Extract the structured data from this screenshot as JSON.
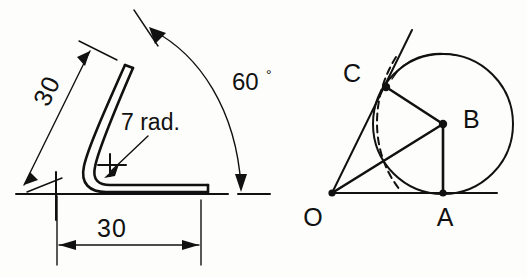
{
  "drawing": {
    "title": "Bent rod dimensioned view and tangent circle construction",
    "background_color": "#fdfdfb",
    "line_color": "#111111"
  },
  "left_figure": {
    "name": "bent-rod-dimensioned-view",
    "dimensions": {
      "leg_angled_length": "30",
      "leg_horizontal_length": "30",
      "bend_angle": "60",
      "degree_symbol": "°",
      "bend_radius_note": "7 rad."
    },
    "labels": {
      "angled_dimension": "30",
      "horizontal_dimension": "30",
      "angle_dimension": "60",
      "radius_note": "7 rad."
    }
  },
  "right_figure": {
    "name": "tangent-circle-construction",
    "points": [
      {
        "id": "O",
        "label": "O",
        "role": "apex-vertex"
      },
      {
        "id": "A",
        "label": "A",
        "role": "tangent-point-on-baseline"
      },
      {
        "id": "B",
        "label": "B",
        "role": "circle-center"
      },
      {
        "id": "C",
        "label": "C",
        "role": "tangent-point-on-ray"
      }
    ],
    "labels": {
      "point_o": "O",
      "point_a": "A",
      "point_b": "B",
      "point_c": "C"
    }
  }
}
